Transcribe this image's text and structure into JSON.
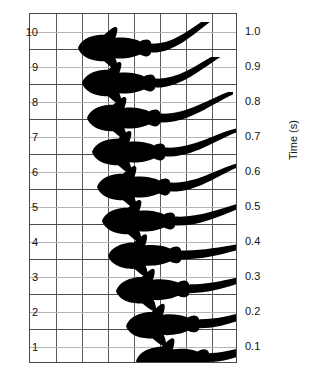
{
  "figure": {
    "kind": "kinematics-sequence-figure",
    "background_color": "#ffffff",
    "ink_color": "#000000",
    "grid_major_color": "#4c4c4c",
    "grid_minor_color": "#b6b6b6",
    "frame_color": "#4a4a4a"
  },
  "axes": {
    "right_title": "Time (s)",
    "left_tick_labels": [
      "10",
      "9",
      "8",
      "7",
      "6",
      "5",
      "4",
      "3",
      "2",
      "1"
    ],
    "right_tick_labels": [
      "1.0",
      "0.9",
      "0.8",
      "0.7",
      "0.6",
      "0.5",
      "0.4",
      "0.3",
      "0.2",
      "0.1"
    ],
    "n_vertical_gridlines": 7,
    "n_columns": 8,
    "plot_left_px": 29,
    "plot_top_px": 13,
    "plot_width_px": 208,
    "plot_height_px": 350
  },
  "chart_data": {
    "type": "scatter",
    "title": "",
    "xlabel": "",
    "ylabel": "Time (s)",
    "legend": [],
    "grid": true,
    "y_axis_left": {
      "name": "frame number",
      "ticks": [
        10,
        9,
        8,
        7,
        6,
        5,
        4,
        3,
        2,
        1
      ],
      "ylim": [
        1,
        10
      ]
    },
    "y_axis_right": {
      "name": "Time (s)",
      "ticks": [
        1.0,
        0.9,
        0.8,
        0.7,
        0.6,
        0.5,
        0.4,
        0.3,
        0.2,
        0.1
      ],
      "ylim": [
        0.1,
        1.0
      ]
    },
    "series": [
      {
        "name": "fish head x-position (grid units)",
        "x": [
          5.1,
          4.6,
          4.1,
          3.7,
          3.3,
          3.0,
          2.7,
          2.5,
          2.3,
          2.1
        ],
        "frames": [
          1,
          2,
          3,
          4,
          5,
          6,
          7,
          8,
          9,
          10
        ],
        "time_s": [
          0.1,
          0.2,
          0.3,
          0.4,
          0.5,
          0.6,
          0.7,
          0.8,
          0.9,
          1.0
        ]
      }
    ],
    "frames": [
      {
        "frame": 1,
        "time_s": 0.1,
        "left_px": 102,
        "top_px": 321,
        "tail_px": 68,
        "tail_lift": -16,
        "body_tilt": -3
      },
      {
        "frame": 2,
        "time_s": 0.2,
        "left_px": 92,
        "top_px": 286,
        "tail_px": 70,
        "tail_lift": -14,
        "body_tilt": -2
      },
      {
        "frame": 3,
        "time_s": 0.3,
        "left_px": 82,
        "top_px": 251,
        "tail_px": 72,
        "tail_lift": -12,
        "body_tilt": -2
      },
      {
        "frame": 4,
        "time_s": 0.4,
        "left_px": 74,
        "top_px": 216,
        "tail_px": 74,
        "tail_lift": -10,
        "body_tilt": -1
      },
      {
        "frame": 5,
        "time_s": 0.5,
        "left_px": 68,
        "top_px": 181,
        "tail_px": 72,
        "tail_lift": -18,
        "body_tilt": 0
      },
      {
        "frame": 6,
        "time_s": 0.6,
        "left_px": 63,
        "top_px": 147,
        "tail_px": 66,
        "tail_lift": -22,
        "body_tilt": 0
      },
      {
        "frame": 7,
        "time_s": 0.7,
        "left_px": 58,
        "top_px": 112,
        "tail_px": 70,
        "tail_lift": -22,
        "body_tilt": 0
      },
      {
        "frame": 8,
        "time_s": 0.8,
        "left_px": 53,
        "top_px": 78,
        "tail_px": 72,
        "tail_lift": -26,
        "body_tilt": 0
      },
      {
        "frame": 9,
        "time_s": 0.9,
        "left_px": 48,
        "top_px": 43,
        "tail_px": 70,
        "tail_lift": -32,
        "body_tilt": 0
      },
      {
        "frame": 10,
        "time_s": 1.0,
        "left_px": 44,
        "top_px": 8,
        "tail_px": 68,
        "tail_lift": -36,
        "body_tilt": 0
      }
    ]
  }
}
